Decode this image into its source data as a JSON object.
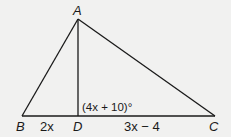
{
  "diagram": {
    "vertices": {
      "A": "A",
      "B": "B",
      "C": "C",
      "D": "D"
    },
    "segments": [
      {
        "name": "AB",
        "from": "A",
        "to": "B"
      },
      {
        "name": "AC",
        "from": "A",
        "to": "C"
      },
      {
        "name": "AD",
        "from": "A",
        "to": "D"
      },
      {
        "name": "BC",
        "from": "B",
        "to": "C"
      }
    ],
    "labels": {
      "BD": "2x",
      "DC": "3x − 4",
      "angle_ADC": "(4x + 10)°"
    }
  }
}
